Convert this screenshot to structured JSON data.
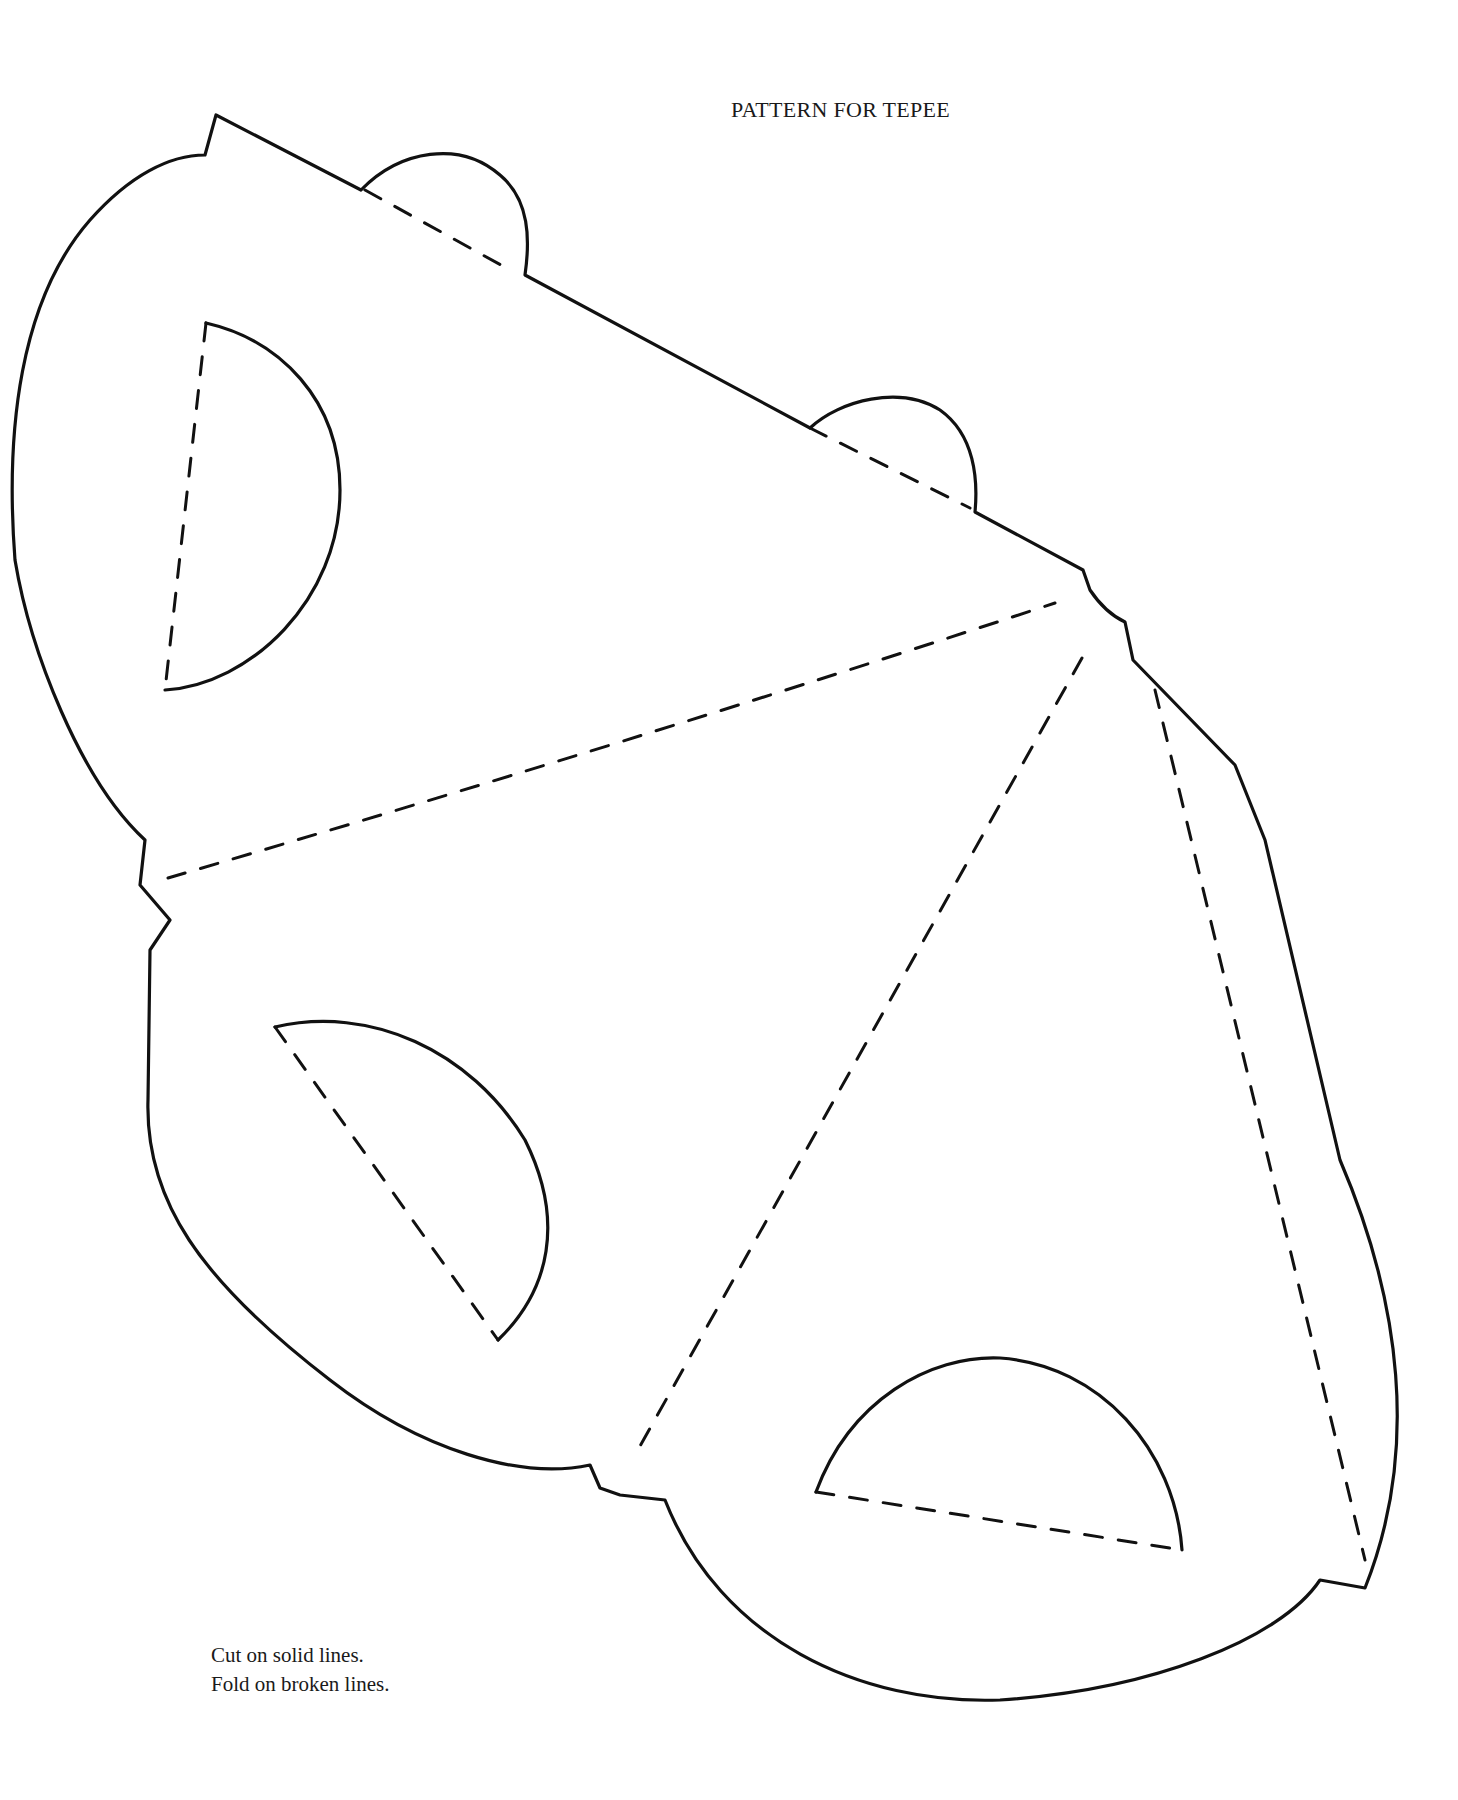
{
  "page": {
    "title": "PATTERN FOR TEPEE",
    "instructions": {
      "line1": "Cut on solid lines.",
      "line2": "Fold on broken lines."
    }
  },
  "legend": {
    "solid_line": "cut",
    "broken_line": "fold"
  },
  "colors": {
    "background": "#ffffff",
    "ink": "#111111"
  }
}
